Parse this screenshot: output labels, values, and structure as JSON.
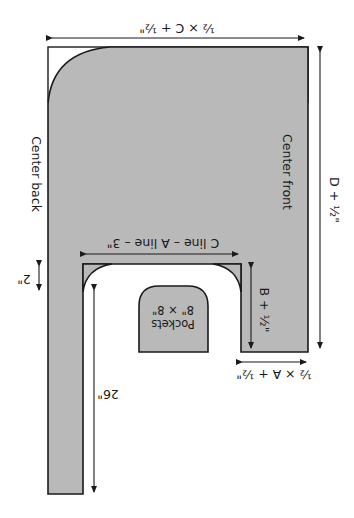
{
  "diagram": {
    "orientation": "rotated 180 degrees",
    "colors": {
      "fabric_fill": "#b9b9b9",
      "line": "#1a1a1a",
      "background": "#ffffff"
    },
    "labels": {
      "top_width": "½ × C + ½\"",
      "center_back": "Center back",
      "center_front": "Center front",
      "right_height": "D + ½\"",
      "notch_width": "C line – A line – 3\"",
      "notch_depth": "B + ½\"",
      "strip_width": "2\"",
      "pocket_title": "Pockets",
      "pocket_size": "8\" × 8\"",
      "bottom_width": "½ × A + ½\"",
      "strip_length": "26\""
    }
  }
}
